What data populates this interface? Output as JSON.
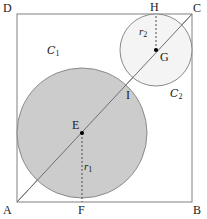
{
  "figure": {
    "canvas": {
      "width": 207,
      "height": 219,
      "background": "#ffffff"
    },
    "colors": {
      "stroke": "#808080",
      "label": "#1a1a1a",
      "circle1_fill": "#cccccc",
      "circle2_fill": "#f2f2f2",
      "dotted": "#555555",
      "point": "#000000"
    },
    "square": {
      "name": "ABCD",
      "corners": [
        {
          "id": "A",
          "label": "A",
          "x": 17,
          "y": 202
        },
        {
          "id": "B",
          "label": "B",
          "x": 192,
          "y": 202
        },
        {
          "id": "C",
          "label": "C",
          "x": 192,
          "y": 14
        },
        {
          "id": "D",
          "label": "D",
          "x": 17,
          "y": 14
        }
      ],
      "side_px": 175
    },
    "circles": [
      {
        "id": "C1",
        "label": "C",
        "label_sub": "1",
        "center_label": "E",
        "center": {
          "x": 82,
          "y": 133
        },
        "radius": 69,
        "fill": "#cccccc",
        "radius_label": "r",
        "radius_sub": "1",
        "tangent_point_label": "F",
        "tangent_point": {
          "x": 82,
          "y": 202
        }
      },
      {
        "id": "C2",
        "label": "C",
        "label_sub": "2",
        "center_label": "G",
        "center": {
          "x": 156,
          "y": 50
        },
        "radius": 36,
        "fill": "#f2f2f2",
        "radius_label": "r",
        "radius_sub": "2",
        "tangent_point_label": "H",
        "tangent_point": {
          "x": 156,
          "y": 14
        }
      }
    ],
    "diagonal": {
      "id": "AC",
      "from": {
        "x": 17,
        "y": 202
      },
      "to": {
        "x": 192,
        "y": 14
      }
    },
    "points": [
      {
        "id": "E",
        "label": "E",
        "x": 82,
        "y": 133,
        "dot": true,
        "label_dx": -9,
        "label_dy": -14
      },
      {
        "id": "G",
        "label": "G",
        "x": 156,
        "y": 50,
        "dot": true,
        "label_dx": 4,
        "label_dy": 2
      },
      {
        "id": "I",
        "label": "I",
        "x": 124,
        "y": 90,
        "dot": false,
        "label_dx": 3,
        "label_dy": 3
      },
      {
        "id": "H",
        "label": "H",
        "x": 156,
        "y": 14,
        "dot": false,
        "label_dx": -4,
        "label_dy": -14
      },
      {
        "id": "F",
        "label": "F",
        "x": 82,
        "y": 202,
        "dot": false,
        "label_dx": -4,
        "label_dy": 3
      }
    ],
    "labels": {
      "A": "A",
      "B": "B",
      "C": "C",
      "D": "D",
      "E": "E",
      "F": "F",
      "G": "G",
      "H": "H",
      "I": "I",
      "r1_base": "r",
      "r1_sub": "1",
      "r2_base": "r",
      "r2_sub": "2",
      "c1_base": "C",
      "c1_sub": "1",
      "c2_base": "C",
      "c2_sub": "2"
    }
  }
}
